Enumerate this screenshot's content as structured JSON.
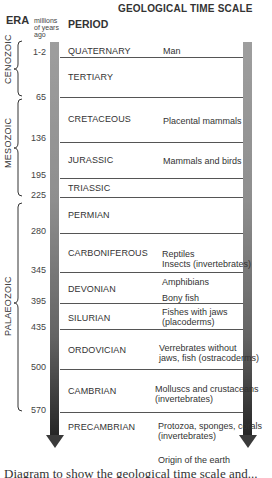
{
  "title": "GEOLOGICAL TIME SCALE",
  "headers": {
    "era": "ERA",
    "mya": "millions of years ago",
    "period": "PERIOD"
  },
  "eras": [
    {
      "name": "CENOZOIC"
    },
    {
      "name": "MESOZOIC"
    },
    {
      "name": "PALAEOZOIC"
    }
  ],
  "boundaries": [
    "1-2",
    "65",
    "136",
    "195",
    "225",
    "280",
    "345",
    "395",
    "435",
    "500",
    "570"
  ],
  "periods": [
    {
      "name": "QUATERNARY",
      "life": "Man"
    },
    {
      "name": "TERTIARY",
      "life": ""
    },
    {
      "name": "CRETACEOUS",
      "life": "Placental mammals"
    },
    {
      "name": "JURASSIC",
      "life": "Mammals and birds"
    },
    {
      "name": "TRIASSIC",
      "life": ""
    },
    {
      "name": "PERMIAN",
      "life": ""
    },
    {
      "name": "CARBONIFEROUS",
      "life": "Reptiles\nInsects (invertebrates)"
    },
    {
      "name": "DEVONIAN",
      "life": "Amphibians"
    },
    {
      "name": "DEVONIAN_2",
      "life": "Bony fish"
    },
    {
      "name": "SILURIAN",
      "life": "Fishes with jaws (placoderms)"
    },
    {
      "name": "ORDOVICIAN",
      "life": "Vertebrates without jaws, fish (ostracoderms)"
    },
    {
      "name": "CAMBRIAN",
      "life": "Molluscs and crustaceans (invertebrates)"
    },
    {
      "name": "PRECAMBRIAN",
      "life": "Protozoa, sponges, corals (invertebrates)"
    }
  ],
  "life_lines": {
    "carboniferous_1": "Reptiles",
    "carboniferous_2": "Insects (invertebrates)",
    "devonian_1": "Amphibians",
    "devonian_2": "Bony fish",
    "silurian_1": "Fishes with jaws",
    "silurian_2": "(placoderms)",
    "ordovician_1": "Verrebrates without",
    "ordovician_2": "jaws, fish (ostracoderms)",
    "cambrian_1": "Molluscs and crustaceans",
    "cambrian_2": "(invertebrates)",
    "precambrian_1": "Protozoa, sponges, corals",
    "precambrian_2": "(invertebrates)"
  },
  "origin": "Origin of the earth",
  "caption_partial": "Diagram to show the geological time scale and..."
}
